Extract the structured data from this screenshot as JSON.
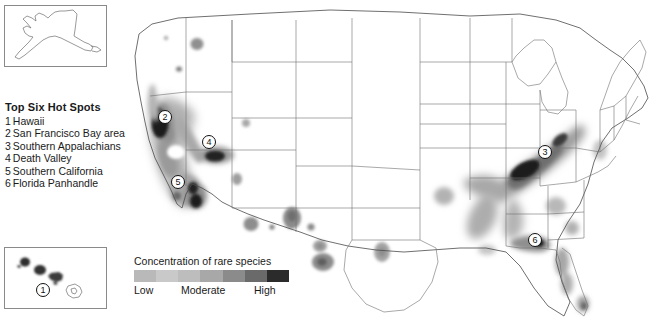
{
  "hotspot_legend": {
    "title": "Top Six Hot Spots",
    "items": [
      {
        "num": "1",
        "label": "Hawaii"
      },
      {
        "num": "2",
        "label": "San Francisco Bay area"
      },
      {
        "num": "3",
        "label": "Southern Appalachians"
      },
      {
        "num": "4",
        "label": "Death Valley"
      },
      {
        "num": "5",
        "label": "Southern California"
      },
      {
        "num": "6",
        "label": "Florida Panhandle"
      }
    ]
  },
  "concentration_legend": {
    "title": "Concentration of rare species",
    "low_label": "Low",
    "moderate_label": "Moderate",
    "high_label": "High",
    "ramp_colors": [
      "#b9b9b9",
      "#c9c9c9",
      "#bdbdbd",
      "#a8a8a8",
      "#8b8b8b",
      "#6a6a6a",
      "#2b2b2b"
    ]
  },
  "map": {
    "background_color": "#ffffff",
    "state_outline_color": "#6e6e6e",
    "density_colors": {
      "low": "#c6c6c6",
      "moderate": "#a6a6a6",
      "high": "#7d7d7d",
      "very_high": "#3a3a3a",
      "peak": "#1c1c1c"
    },
    "markers": [
      {
        "num": "2",
        "x": 165,
        "y": 117,
        "region": "San Francisco Bay area"
      },
      {
        "num": "4",
        "x": 209,
        "y": 142,
        "region": "Death Valley"
      },
      {
        "num": "5",
        "x": 178,
        "y": 182,
        "region": "Southern California"
      },
      {
        "num": "3",
        "x": 545,
        "y": 152,
        "region": "Southern Appalachians"
      },
      {
        "num": "6",
        "x": 535,
        "y": 240,
        "region": "Florida Panhandle"
      },
      {
        "num": "1",
        "x": 41,
        "y": 289,
        "region": "Hawaii"
      }
    ]
  },
  "insets": {
    "alaska": {
      "name": "Alaska"
    },
    "hawaii": {
      "name": "Hawaii"
    }
  }
}
